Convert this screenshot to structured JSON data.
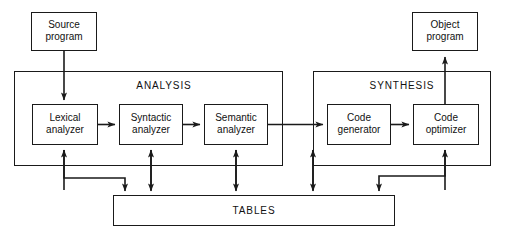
{
  "diagram": {
    "background_color": "#ffffff",
    "line_color": "#1a1a1a",
    "text_color": "#111111",
    "groups": [
      {
        "id": "analysis",
        "label": "ANALYSIS"
      },
      {
        "id": "synthesis",
        "label": "SYNTHESIS"
      }
    ],
    "nodes": [
      {
        "id": "source-program",
        "label": "Source\nprogram"
      },
      {
        "id": "object-program",
        "label": "Object\nprogram"
      },
      {
        "id": "lexical-analyzer",
        "label": "Lexical\nanalyzer"
      },
      {
        "id": "syntactic-analyzer",
        "label": "Syntactic\nanalyzer"
      },
      {
        "id": "semantic-analyzer",
        "label": "Semantic\nanalyzer"
      },
      {
        "id": "code-generator",
        "label": "Code\ngenerator"
      },
      {
        "id": "code-optimizer",
        "label": "Code\noptimizer"
      },
      {
        "id": "tables",
        "label": "TABLES"
      }
    ],
    "edges": [
      {
        "from": "source-program",
        "to": "lexical-analyzer",
        "style": "arrow-down"
      },
      {
        "from": "lexical-analyzer",
        "to": "syntactic-analyzer",
        "style": "arrow-right"
      },
      {
        "from": "syntactic-analyzer",
        "to": "semantic-analyzer",
        "style": "arrow-right"
      },
      {
        "from": "semantic-analyzer",
        "to": "code-generator",
        "style": "arrow-right"
      },
      {
        "from": "code-generator",
        "to": "code-optimizer",
        "style": "arrow-right"
      },
      {
        "from": "code-optimizer",
        "to": "object-program",
        "style": "arrow-up"
      },
      {
        "from": "lexical-analyzer",
        "to": "tables",
        "style": "bidirectional"
      },
      {
        "from": "syntactic-analyzer",
        "to": "tables",
        "style": "bidirectional"
      },
      {
        "from": "semantic-analyzer",
        "to": "tables",
        "style": "bidirectional"
      },
      {
        "from": "code-generator",
        "to": "tables",
        "style": "bidirectional"
      },
      {
        "from": "code-optimizer",
        "to": "tables",
        "style": "bidirectional"
      }
    ]
  }
}
